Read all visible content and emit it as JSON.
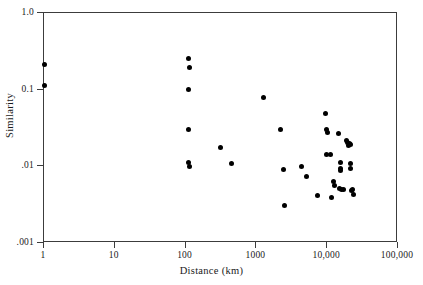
{
  "chart_data": {
    "type": "scatter",
    "title": "",
    "xlabel": "Distance (km)",
    "ylabel": "Similarity",
    "xscale": "log",
    "yscale": "log",
    "xlim": [
      1,
      100000
    ],
    "ylim": [
      0.001,
      1.0
    ],
    "grid": false,
    "legend": null,
    "marker": "filled-circle",
    "marker_color": "#000000",
    "xticks": [
      {
        "value": 1,
        "label": "1"
      },
      {
        "value": 10,
        "label": "10"
      },
      {
        "value": 100,
        "label": "100"
      },
      {
        "value": 1000,
        "label": "1000"
      },
      {
        "value": 10000,
        "label": "10,000"
      },
      {
        "value": 100000,
        "label": "100,000"
      }
    ],
    "yticks": [
      {
        "value": 1.0,
        "label": "1.0"
      },
      {
        "value": 0.1,
        "label": "0.1"
      },
      {
        "value": 0.01,
        "label": ".01"
      },
      {
        "value": 0.001,
        "label": ".001"
      }
    ],
    "points": [
      {
        "x": 1,
        "y": 0.215
      },
      {
        "x": 1,
        "y": 0.112
      },
      {
        "x": 110,
        "y": 0.255
      },
      {
        "x": 112,
        "y": 0.196
      },
      {
        "x": 110,
        "y": 0.1
      },
      {
        "x": 110,
        "y": 0.0305
      },
      {
        "x": 110,
        "y": 0.0113
      },
      {
        "x": 112,
        "y": 0.01
      },
      {
        "x": 310,
        "y": 0.0178
      },
      {
        "x": 450,
        "y": 0.0108
      },
      {
        "x": 1250,
        "y": 0.08
      },
      {
        "x": 2200,
        "y": 0.0305
      },
      {
        "x": 2400,
        "y": 0.0092
      },
      {
        "x": 2500,
        "y": 0.0031
      },
      {
        "x": 4300,
        "y": 0.0101
      },
      {
        "x": 5100,
        "y": 0.0074
      },
      {
        "x": 7200,
        "y": 0.0042
      },
      {
        "x": 9500,
        "y": 0.0485
      },
      {
        "x": 9800,
        "y": 0.0298
      },
      {
        "x": 10000,
        "y": 0.0275
      },
      {
        "x": 9900,
        "y": 0.0142
      },
      {
        "x": 11200,
        "y": 0.0141
      },
      {
        "x": 11500,
        "y": 0.0039
      },
      {
        "x": 12300,
        "y": 0.0063
      },
      {
        "x": 12500,
        "y": 0.0057
      },
      {
        "x": 14500,
        "y": 0.027
      },
      {
        "x": 15500,
        "y": 0.0111
      },
      {
        "x": 15200,
        "y": 0.0095
      },
      {
        "x": 15400,
        "y": 0.0088
      },
      {
        "x": 15000,
        "y": 0.0051
      },
      {
        "x": 16000,
        "y": 0.005
      },
      {
        "x": 16800,
        "y": 0.005
      },
      {
        "x": 19000,
        "y": 0.0218
      },
      {
        "x": 19500,
        "y": 0.0205
      },
      {
        "x": 20500,
        "y": 0.02
      },
      {
        "x": 20000,
        "y": 0.0188
      },
      {
        "x": 21000,
        "y": 0.0192
      },
      {
        "x": 21500,
        "y": 0.011
      },
      {
        "x": 21000,
        "y": 0.0094
      },
      {
        "x": 22000,
        "y": 0.0049
      },
      {
        "x": 23000,
        "y": 0.005
      },
      {
        "x": 23500,
        "y": 0.0043
      }
    ]
  }
}
